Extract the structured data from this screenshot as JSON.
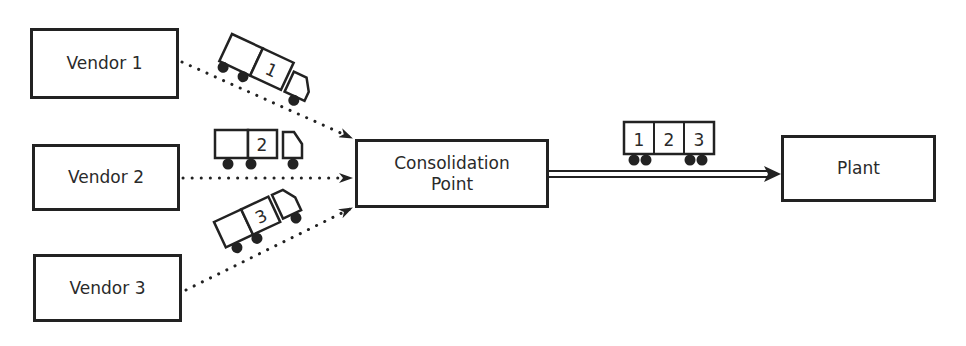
{
  "diagram": {
    "type": "flow",
    "description_nodes": [
      "Vendor 1",
      "Vendor 2",
      "Vendor 3",
      "Consolidation Point",
      "Plant"
    ],
    "nodes": {
      "vendor1": {
        "label": "Vendor 1"
      },
      "vendor2": {
        "label": "Vendor 2"
      },
      "vendor3": {
        "label": "Vendor 3"
      },
      "consolidation": {
        "label_line1": "Consolidation",
        "label_line2": "Point"
      },
      "plant": {
        "label": "Plant"
      }
    },
    "trucks": [
      {
        "number": "1",
        "from": "Vendor 1",
        "to": "Consolidation Point"
      },
      {
        "number": "2",
        "from": "Vendor 2",
        "to": "Consolidation Point"
      },
      {
        "number": "3",
        "from": "Vendor 3",
        "to": "Consolidation Point"
      }
    ],
    "railcar": {
      "compartments": [
        "1",
        "2",
        "3"
      ],
      "from": "Consolidation Point",
      "to": "Plant"
    },
    "edges": [
      {
        "from": "Vendor 1",
        "to": "Consolidation Point",
        "style": "dotted-arrow"
      },
      {
        "from": "Vendor 2",
        "to": "Consolidation Point",
        "style": "dotted-arrow"
      },
      {
        "from": "Vendor 3",
        "to": "Consolidation Point",
        "style": "dotted-arrow"
      },
      {
        "from": "Consolidation Point",
        "to": "Plant",
        "style": "double-line-arrow"
      }
    ],
    "colors": {
      "line": "#222222",
      "text": "#2a2a2a",
      "background": "#ffffff"
    }
  }
}
